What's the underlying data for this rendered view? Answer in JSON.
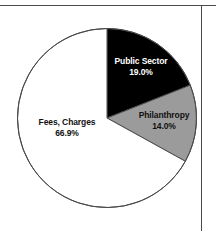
{
  "chart_data": {
    "type": "pie",
    "title": "",
    "subtitle": "",
    "xlabel": "",
    "ylabel": "",
    "legend_position": "none",
    "grid": false,
    "categories": [
      "Public Sector",
      "Philanthropy",
      "Fees, Charges"
    ],
    "values": [
      19.0,
      14.0,
      66.9
    ],
    "value_labels": [
      "19.0%",
      "14.0%",
      "66.9%"
    ],
    "slice_colors": [
      "#000000",
      "#9b9b9b",
      "#ffffff"
    ],
    "label_colors": [
      "#ffffff",
      "#111111",
      "#111111"
    ],
    "start_angle_deg": 0,
    "direction": "clockwise",
    "units": "percent",
    "slices": [
      {
        "name": "Public Sector",
        "value": 19.0,
        "label": "19.0%",
        "fill": "#000000",
        "text_color": "#ffffff"
      },
      {
        "name": "Philanthropy",
        "value": 14.0,
        "label": "14.0%",
        "fill": "#9b9b9b",
        "text_color": "#111111"
      },
      {
        "name": "Fees, Charges",
        "value": 66.9,
        "label": "66.9%",
        "fill": "#ffffff",
        "text_color": "#111111"
      }
    ]
  },
  "figure": {
    "background": "#ffffff",
    "outline_color": "#4a4a4a",
    "rule_color": "#4a4a4a"
  }
}
